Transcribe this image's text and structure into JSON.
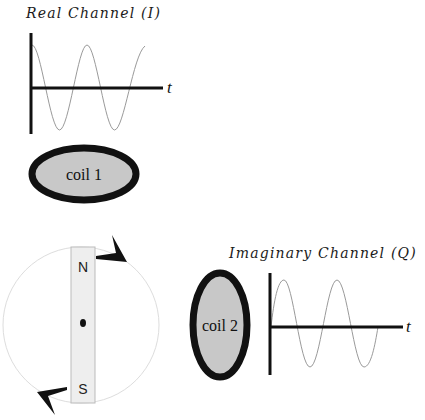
{
  "real_channel": {
    "title": "Real Channel  (I)",
    "axis_label": "t",
    "waveform": "cosine",
    "cycles": 2.1
  },
  "imaginary_channel": {
    "title": "Imaginary Channel  (Q)",
    "axis_label": "t",
    "waveform": "sine",
    "cycles": 2.0
  },
  "coil1": {
    "label": "coil 1"
  },
  "coil2": {
    "label": "coil 2"
  },
  "magnet": {
    "north_label": "N",
    "south_label": "S"
  },
  "colors": {
    "ink": "#111111",
    "coil_fill": "#c8c8c8",
    "magnet_fill": "#eeeeee",
    "wave": "#9a9a9a",
    "rotation_circle": "#dddddd"
  }
}
